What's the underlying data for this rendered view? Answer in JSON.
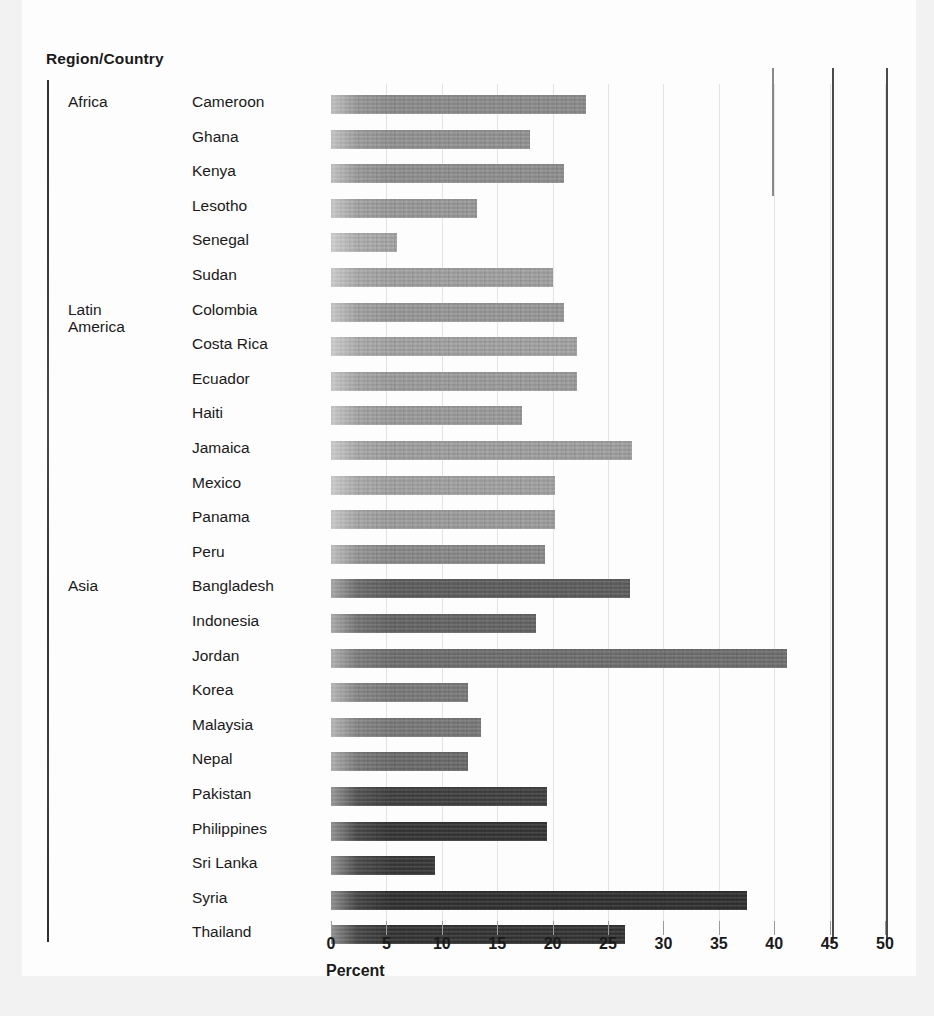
{
  "header": {
    "column_title": "Region/Country"
  },
  "axis": {
    "title": "Percent",
    "ticks": [
      0,
      5,
      10,
      15,
      20,
      25,
      30,
      35,
      40,
      45,
      50
    ],
    "tick_labels": [
      "0",
      "5",
      "10",
      "15",
      "20",
      "25",
      "30",
      "35",
      "40",
      "45",
      "50"
    ]
  },
  "regions": [
    {
      "name": "Africa",
      "row_index": 0
    },
    {
      "name": "Latin\nAmerica",
      "row_index": 6
    },
    {
      "name": "Asia",
      "row_index": 14
    }
  ],
  "chart_data": {
    "type": "bar",
    "orientation": "horizontal",
    "title": "",
    "subtitle": "",
    "xlabel": "Percent",
    "ylabel": "Region/Country",
    "xlim": [
      0,
      50
    ],
    "xticks": [
      0,
      5,
      10,
      15,
      20,
      25,
      30,
      35,
      40,
      45,
      50
    ],
    "grid": true,
    "legend": "none",
    "categories": [
      "Cameroon",
      "Ghana",
      "Kenya",
      "Lesotho",
      "Senegal",
      "Sudan",
      "Colombia",
      "Costa Rica",
      "Ecuador",
      "Haiti",
      "Jamaica",
      "Mexico",
      "Panama",
      "Peru",
      "Bangladesh",
      "Indonesia",
      "Jordan",
      "Korea",
      "Malaysia",
      "Nepal",
      "Pakistan",
      "Philippines",
      "Sri Lanka",
      "Syria",
      "Thailand"
    ],
    "values": [
      23.0,
      18.0,
      21.0,
      13.2,
      6.0,
      20.0,
      21.0,
      22.2,
      22.2,
      17.2,
      27.2,
      20.2,
      20.2,
      19.3,
      27.0,
      18.5,
      41.2,
      12.4,
      13.5,
      12.4,
      19.5,
      19.5,
      9.4,
      37.5,
      26.5
    ],
    "groups": [
      {
        "name": "Africa",
        "categories": [
          "Cameroon",
          "Ghana",
          "Kenya",
          "Lesotho",
          "Senegal",
          "Sudan"
        ]
      },
      {
        "name": "Latin America",
        "categories": [
          "Colombia",
          "Costa Rica",
          "Ecuador",
          "Haiti",
          "Jamaica",
          "Mexico",
          "Panama",
          "Peru"
        ]
      },
      {
        "name": "Asia",
        "categories": [
          "Bangladesh",
          "Indonesia",
          "Jordan",
          "Korea",
          "Malaysia",
          "Nepal",
          "Pakistan",
          "Philippines",
          "Sri Lanka",
          "Syria",
          "Thailand"
        ]
      }
    ],
    "bar_shades": [
      "#8e8e8e",
      "#949494",
      "#909090",
      "#9b9b9b",
      "#a8a8a8",
      "#a3a3a3",
      "#9a9a9a",
      "#a5a5a5",
      "#9e9e9e",
      "#9d9d9d",
      "#a2a2a2",
      "#a4a4a4",
      "#9f9f9f",
      "#8a8a8a",
      "#5c5c5c",
      "#636363",
      "#6e6e6e",
      "#7a7a7a",
      "#787878",
      "#6a6a6a",
      "#3c3c3c",
      "#303030",
      "#343434",
      "#2b2b2b",
      "#2e2e2e"
    ]
  }
}
